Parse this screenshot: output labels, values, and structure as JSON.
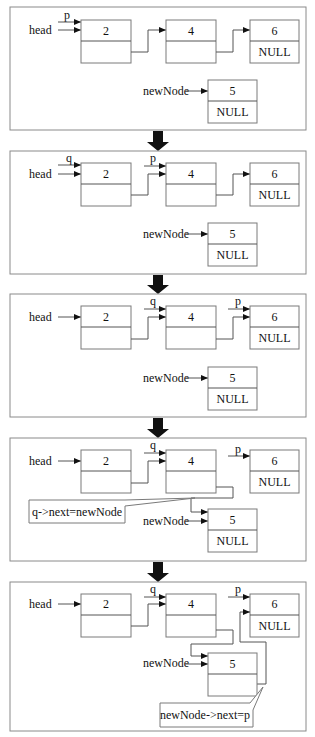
{
  "diagram": {
    "colors": {
      "border": "#8a8a8a",
      "line": "#555555",
      "arrow": "#111111",
      "background": "#ffffff"
    },
    "labels": {
      "head": "head",
      "p": "p",
      "q": "q",
      "newNode": "newNode",
      "null": "NULL"
    },
    "nodes": {
      "n2": "2",
      "n4": "4",
      "n6": "6",
      "n5": "5"
    },
    "panels": [
      {
        "step": 1,
        "p_at": "2",
        "q_at": null,
        "description": "p points to head node"
      },
      {
        "step": 2,
        "p_at": "4",
        "q_at": "2",
        "description": "q = p; p = p->next"
      },
      {
        "step": 3,
        "p_at": "6",
        "q_at": "4",
        "description": "advance q and p"
      },
      {
        "step": 4,
        "p_at": "6",
        "q_at": "4",
        "callout": "q->next=newNode"
      },
      {
        "step": 5,
        "p_at": "6",
        "q_at": "4",
        "callout": "newNode->next=p"
      }
    ]
  }
}
